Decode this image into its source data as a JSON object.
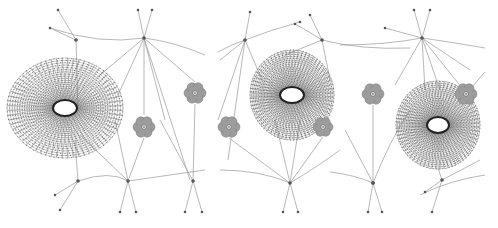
{
  "figure": {
    "panels": [
      {
        "id": "panel-1",
        "mesh": {
          "cx": 65,
          "cy": 108,
          "rx": 58,
          "ry": 50,
          "hole_rx": 12,
          "hole_ry": 8
        },
        "flowers": [
          {
            "cx": 144,
            "cy": 127,
            "r": 11
          },
          {
            "cx": 195,
            "cy": 93,
            "r": 11
          }
        ],
        "hubs": [
          {
            "x": 144,
            "y": 38
          },
          {
            "x": 128,
            "y": 181
          },
          {
            "x": 193,
            "y": 181
          },
          {
            "x": 76,
            "y": 40
          },
          {
            "x": 78,
            "y": 181
          }
        ]
      },
      {
        "id": "panel-2",
        "mesh": {
          "cx": 292,
          "cy": 95,
          "rx": 42,
          "ry": 45,
          "hole_rx": 12,
          "hole_ry": 8
        },
        "flowers": [
          {
            "cx": 229,
            "cy": 127,
            "r": 11
          },
          {
            "cx": 323,
            "cy": 127,
            "r": 10
          },
          {
            "cx": 373,
            "cy": 94,
            "r": 11
          }
        ],
        "hubs": [
          {
            "x": 245,
            "y": 40
          },
          {
            "x": 322,
            "y": 40
          },
          {
            "x": 290,
            "y": 183
          },
          {
            "x": 373,
            "y": 183
          }
        ]
      },
      {
        "id": "panel-3",
        "mesh": {
          "cx": 438,
          "cy": 125,
          "rx": 42,
          "ry": 44,
          "hole_rx": 11,
          "hole_ry": 8
        },
        "flowers": [
          {
            "cx": 466,
            "cy": 94,
            "r": 11
          }
        ],
        "hubs": [
          {
            "x": 422,
            "y": 38
          },
          {
            "x": 442,
            "y": 180
          },
          {
            "x": 373,
            "y": 183
          }
        ]
      }
    ],
    "colors": {
      "edge": "#9a9a9a",
      "mesh": "#6e6e6e",
      "flower": "#9c9c9c",
      "background": "#ffffff"
    }
  }
}
